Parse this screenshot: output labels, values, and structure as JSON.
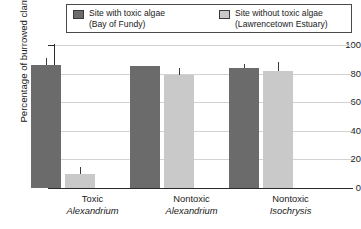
{
  "chart_data": {
    "type": "bar",
    "title": "",
    "xlabel": "",
    "ylabel": "Percentage of burrowed clams",
    "ylim": [
      0,
      100
    ],
    "ytick_labels": [
      "100",
      "80",
      "60",
      "40",
      "20",
      "0"
    ],
    "ytick_values": [
      100,
      80,
      60,
      40,
      20,
      0
    ],
    "grid": true,
    "legend_position": "top",
    "categories": [
      {
        "line1": "Toxic",
        "line2": "Alexandrium"
      },
      {
        "line1": "Nontoxic",
        "line2": "Alexandrium"
      },
      {
        "line1": "Nontoxic",
        "line2": "Isochrysis"
      }
    ],
    "series": [
      {
        "name": "Site with toxic algae",
        "sub": "(Bay of Fundy)",
        "color": "#6b6b6b",
        "values": [
          86,
          85,
          84
        ],
        "errors": [
          5,
          0,
          3
        ]
      },
      {
        "name": "Site without toxic algae",
        "sub": "(Lawrencetown Estuary)",
        "color": "#c9c9c9",
        "values": [
          10,
          79,
          82
        ],
        "errors": [
          5,
          5,
          6
        ]
      }
    ]
  },
  "legend": {
    "entries": [
      {
        "label": "Site with toxic algae",
        "sub": "(Bay of Fundy)",
        "swatch": "#6b6b6b"
      },
      {
        "label": "Site without toxic algae",
        "sub": "(Lawrencetown Estuary)",
        "swatch": "#c9c9c9"
      }
    ]
  }
}
